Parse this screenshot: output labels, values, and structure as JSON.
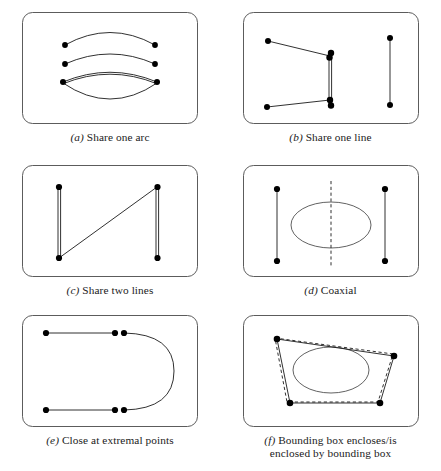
{
  "figure": {
    "type": "six-panel-geometry-diagram",
    "background": "#ffffff",
    "stroke_color": "#1a1a1a",
    "frame_color": "#4a4a4a",
    "dot_color": "#000000",
    "panels": [
      {
        "id": "a",
        "label": "(a)",
        "caption": "Share one arc",
        "caption_full": "(a) Share one arc",
        "description": "Three arcs stacked above an ellipse; the lowest arc is doubled and coincides with the top of the ellipse",
        "shapes": [
          "arc",
          "arc",
          "arc-doubled",
          "ellipse"
        ],
        "endpoint_count": 6
      },
      {
        "id": "b",
        "label": "(b)",
        "caption": "Share one line",
        "caption_full": "(b) Share one line",
        "description": "Two open polylines sharing a common vertical segment, plus a separate vertical segment at right",
        "shapes": [
          "polyline",
          "polyline",
          "shared-vertical-segment",
          "vertical-segment"
        ],
        "endpoint_count": 7
      },
      {
        "id": "c",
        "label": "(c)",
        "caption": "Share two lines",
        "caption_full": "(c) Share two lines",
        "description": "Two doubled vertical segments joined by a diagonal segment",
        "shapes": [
          "vertical-doubled",
          "vertical-doubled",
          "diagonal"
        ],
        "endpoint_count": 4
      },
      {
        "id": "d",
        "label": "(d)",
        "caption": "Coaxial",
        "caption_full": "(d) Coaxial",
        "description": "Two vertical segments flanking an ellipse with a vertical dashed axis of symmetry through the ellipse",
        "shapes": [
          "vertical-segment",
          "ellipse",
          "vertical-segment",
          "dashed-axis"
        ],
        "endpoint_count": 4
      },
      {
        "id": "e",
        "label": "(e)",
        "caption": "Close at extremal points",
        "caption_full": "(e) Close at extremal points",
        "description": "Two horizontal segments whose right endpoints nearly touch the endpoints of a semicircular arc",
        "shapes": [
          "horizontal-segment",
          "horizontal-segment",
          "semicircular-arc"
        ],
        "endpoint_count": 6
      },
      {
        "id": "f",
        "label": "(f)",
        "caption": "Bounding box encloses/is\nenclosed by bounding box",
        "caption_full": "(f) Bounding box encloses/is enclosed by bounding box",
        "description": "Solid quadrilateral with a slightly offset dashed quadrilateral, containing an ellipse",
        "shapes": [
          "quadrilateral-solid",
          "quadrilateral-dashed",
          "ellipse"
        ],
        "endpoint_count": 4
      }
    ]
  }
}
